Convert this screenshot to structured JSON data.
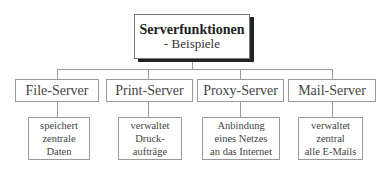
{
  "diagram": {
    "root": {
      "title": "Serverfunktionen",
      "subtitle": "- Beispiele"
    },
    "categories": [
      {
        "label": "File-Server",
        "description": [
          "speichert",
          "zentrale",
          "Daten"
        ]
      },
      {
        "label": "Print-Server",
        "description": [
          "verwaltet",
          "Druck-",
          "aufträge"
        ]
      },
      {
        "label": "Proxy-Server",
        "description": [
          "Anbindung",
          "eines Netzes",
          "an das Internet"
        ]
      },
      {
        "label": "Mail-Server",
        "description": [
          "verwaltet",
          "zentral",
          "alle E-Mails"
        ]
      }
    ]
  }
}
